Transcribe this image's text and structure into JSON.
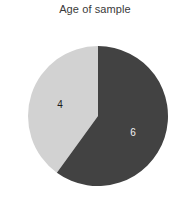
{
  "chart_data": {
    "type": "pie",
    "title": "Age of sample",
    "xlabel": "",
    "ylabel": "",
    "categories": [
      "4",
      "6"
    ],
    "values": [
      4,
      6
    ],
    "labels": [
      "4",
      "6"
    ],
    "colors": [
      "#d2d2d2",
      "#424242"
    ],
    "label_colors": [
      "#1c1c1c",
      "#f2f2f2"
    ],
    "total": 10,
    "start_angle_deg": 0,
    "direction": "clockwise",
    "legend": "none",
    "grid": false,
    "background": "#ffffff",
    "slices": [
      {
        "label": "4",
        "value": 4,
        "color": "#d2d2d2",
        "label_color": "#1c1c1c",
        "start_deg": 216,
        "end_deg": 360,
        "sweep_deg": 144,
        "fraction": 0.4
      },
      {
        "label": "6",
        "value": 6,
        "color": "#424242",
        "label_color": "#f2f2f2",
        "start_deg": 0,
        "end_deg": 216,
        "sweep_deg": 216,
        "fraction": 0.6
      }
    ],
    "geometry": {
      "center_x": 98,
      "center_y": 116,
      "radius": 70
    }
  }
}
